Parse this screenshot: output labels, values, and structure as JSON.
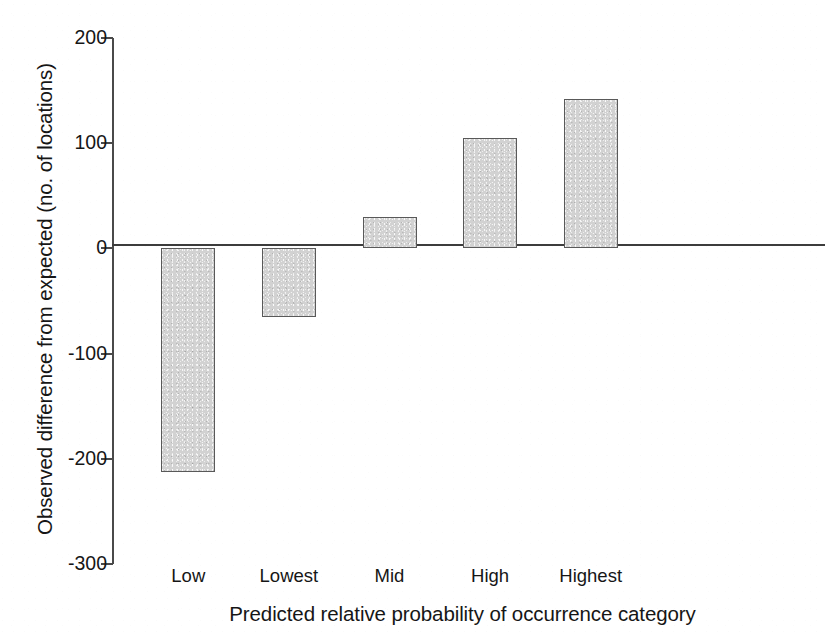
{
  "chart_data": {
    "type": "bar",
    "title": "",
    "subtitle": "",
    "xlabel": "Predicted relative probability of occurrence category",
    "ylabel": "Observed difference from expected (no. of locations)",
    "categories": [
      "Low",
      "Lowest",
      "Mid",
      "High",
      "Highest"
    ],
    "values": [
      -213,
      -65,
      30,
      105,
      142
    ],
    "ylim": [
      -300,
      200
    ],
    "yticks": [
      200,
      100,
      0,
      -100,
      -200,
      -300
    ],
    "ytick_labels": [
      "200",
      "100",
      "0",
      "-100",
      "-200",
      "-300"
    ],
    "grid": false,
    "legend": null,
    "bar_fill_color": "#d2d2d2",
    "bar_edge_color": "#595959",
    "axis_color": "#4a4a4a",
    "background_color": "#ffffff",
    "series": [
      {
        "name": "Observed difference from expected",
        "values": [
          -213,
          -65,
          30,
          105,
          142
        ]
      }
    ],
    "points": [
      {
        "category": "Low",
        "value": -213
      },
      {
        "category": "Lowest",
        "value": -65
      },
      {
        "category": "Mid",
        "value": 30
      },
      {
        "category": "High",
        "value": 105
      },
      {
        "category": "Highest",
        "value": 142
      }
    ]
  }
}
